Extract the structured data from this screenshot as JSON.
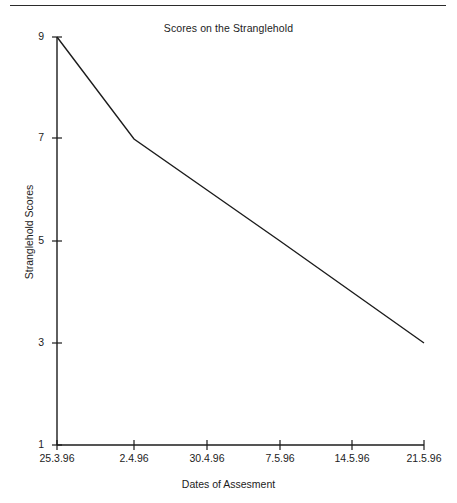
{
  "figure": {
    "has_top_rule": true,
    "background_color": "#ffffff",
    "ink_color": "#1c1c1c"
  },
  "chart_data": {
    "type": "line",
    "title": "Scores on the Stranglehold",
    "xlabel": "Dates of Assesment",
    "ylabel": "Stranglehold Scores",
    "categories": [
      "25.3.96",
      "2.4.96",
      "30.4.96",
      "7.5.96",
      "14.5.96",
      "21.5.96"
    ],
    "x": [
      "25.3.96",
      "2.4.96",
      "30.4.96",
      "7.5.96",
      "14.5.96",
      "21.5.96"
    ],
    "values": [
      9,
      7,
      6,
      5,
      4,
      3
    ],
    "series": [
      {
        "name": "Stranglehold Scores",
        "values": [
          9,
          7,
          6,
          5,
          4,
          3
        ],
        "color": "#1c1c1c"
      }
    ],
    "ylim": [
      1,
      9
    ],
    "ytick_labels": [
      "9",
      "7",
      "5",
      "3",
      "1"
    ],
    "ytick_values": [
      9,
      7,
      5,
      3,
      1
    ],
    "xtick_labels": [
      "25.3.96",
      "2.4.96",
      "30.4.96",
      "7.5.96",
      "14.5.96",
      "21.5.96"
    ],
    "grid": false,
    "legend": false,
    "markers": false,
    "line_color": "#1c1c1c",
    "line_width": 1.4
  }
}
